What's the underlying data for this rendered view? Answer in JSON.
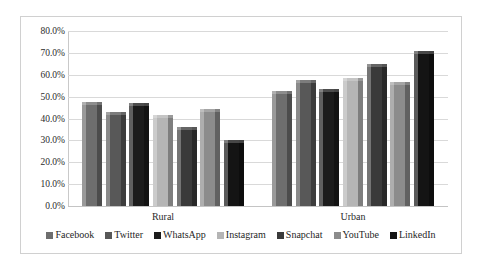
{
  "chart_data": {
    "type": "bar",
    "title": "",
    "subtitle": "",
    "xlabel": "",
    "ylabel": "",
    "categories": [
      "Rural",
      "Urban"
    ],
    "ylim": [
      0,
      0.8
    ],
    "ytick_labels": [
      "80.0%",
      "70.0%",
      "60.0%",
      "50.0%",
      "40.0%",
      "30.0%",
      "20.0%",
      "10.0%",
      "0.0%"
    ],
    "ytick_values": [
      80.0,
      70.0,
      60.0,
      50.0,
      40.0,
      30.0,
      20.0,
      10.0,
      0.0
    ],
    "grid": true,
    "legend_position": "bottom",
    "value_suffix": "%",
    "series": [
      {
        "name": "Facebook",
        "color": "#6e6e6e",
        "values": [
          47.5,
          52.5
        ]
      },
      {
        "name": "Twitter",
        "color": "#585858",
        "values": [
          43.0,
          57.5
        ]
      },
      {
        "name": "WhatsApp",
        "color": "#1c1c1c",
        "values": [
          47.0,
          53.5
        ]
      },
      {
        "name": "Instagram",
        "color": "#b5b5b5",
        "values": [
          41.5,
          58.5
        ]
      },
      {
        "name": "Snapchat",
        "color": "#3a3a3a",
        "values": [
          36.0,
          65.0
        ]
      },
      {
        "name": "YouTube",
        "color": "#8c8c8c",
        "values": [
          44.5,
          56.5
        ]
      },
      {
        "name": "LinkedIn",
        "color": "#141414",
        "values": [
          30.0,
          71.0
        ]
      }
    ]
  },
  "legend": {
    "items": [
      {
        "label": "Facebook"
      },
      {
        "label": "Twitter"
      },
      {
        "label": "WhatsApp"
      },
      {
        "label": "Instagram"
      },
      {
        "label": "Snapchat"
      },
      {
        "label": "YouTube"
      },
      {
        "label": "LinkedIn"
      }
    ]
  },
  "axis": {
    "category_labels": [
      "Rural",
      "Urban"
    ]
  }
}
